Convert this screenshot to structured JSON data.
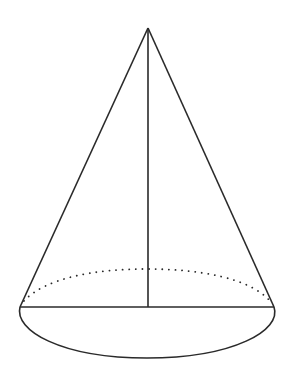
{
  "diagram": {
    "type": "cone",
    "colors": {
      "stroke": "#2a2a2a",
      "background": "#ffffff"
    },
    "apex": {
      "x": 148,
      "y": 28
    },
    "base": {
      "center": {
        "x": 147,
        "y": 307
      },
      "left": {
        "x": 20,
        "y": 307
      },
      "right": {
        "x": 274,
        "y": 307
      },
      "front_bottom_y": 358,
      "back_top_y": 269
    },
    "elements": [
      {
        "name": "left-slant-edge",
        "style": "solid"
      },
      {
        "name": "right-slant-edge",
        "style": "solid"
      },
      {
        "name": "height-line",
        "style": "solid"
      },
      {
        "name": "base-diameter",
        "style": "solid"
      },
      {
        "name": "base-front-arc",
        "style": "solid"
      },
      {
        "name": "base-back-arc",
        "style": "dotted"
      }
    ]
  }
}
